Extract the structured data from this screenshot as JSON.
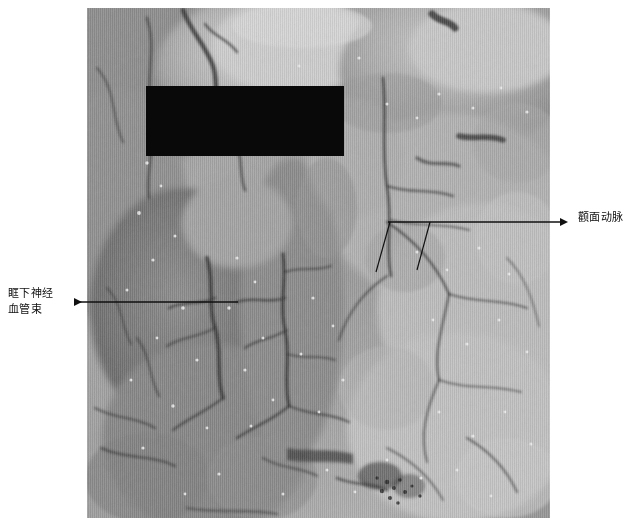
{
  "figure": {
    "type": "anatomical-dissection-photograph",
    "modality": "grayscale-photo",
    "width": 629,
    "height": 527,
    "background_color": "#ffffff"
  },
  "photo": {
    "name": "facial-dissection-specimen",
    "x": 87,
    "y": 8,
    "width": 463,
    "height": 510,
    "description_visible_text": "",
    "base_tone": "#9a9a9a"
  },
  "redaction": {
    "name": "black-redaction-bar",
    "x": 146,
    "y": 86,
    "width": 198,
    "height": 70,
    "color": "#090909"
  },
  "annotations": [
    {
      "id": "infraorbital",
      "line1": "眶下神经",
      "line2": "血管束",
      "label_x": 8,
      "label_y": 286,
      "arrow": {
        "type": "single-horizontal",
        "tip_x": 66,
        "tail_x": 238,
        "y": 302,
        "direction": "left",
        "color": "#111111"
      }
    },
    {
      "id": "zygomaticofacial",
      "line1": "颧面动脉",
      "line2": "",
      "label_x": 578,
      "label_y": 210,
      "arrow": {
        "type": "horizontal-with-two-leaders",
        "tip_x": 568,
        "tail_x": 388,
        "y": 222,
        "direction": "right",
        "color": "#111111",
        "leaders": [
          {
            "x1": 390,
            "y1": 222,
            "x2": 376,
            "y2": 272
          },
          {
            "x1": 430,
            "y1": 222,
            "x2": 417,
            "y2": 270
          }
        ]
      }
    }
  ],
  "colors": {
    "page_background": "#ffffff",
    "annotation_ink": "#111111",
    "redaction": "#090909"
  }
}
